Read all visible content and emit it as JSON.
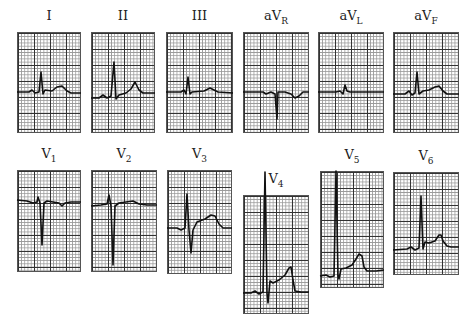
{
  "figure": {
    "leads": [
      {
        "id": "I",
        "name": "I",
        "sub": "",
        "x": 17,
        "y": 32,
        "w": 64,
        "h": 101,
        "path": "M0,60 L12,60 L15,58 L18,61 L22,60 L24,40 L26,62 L28,58 L35,59 L40,55 L45,54 L50,59 L54,61 L64,61"
      },
      {
        "id": "II",
        "name": "II",
        "sub": "",
        "x": 91,
        "y": 32,
        "w": 64,
        "h": 101,
        "path": "M0,66 L8,66 L12,63 L16,66 L20,64 L23,30 L25,67 L28,63 L35,61 L40,57 L44,50 L48,58 L52,61 L64,61"
      },
      {
        "id": "III",
        "name": "III",
        "sub": "",
        "x": 166,
        "y": 32,
        "w": 67,
        "h": 101,
        "path": "M0,60 L15,60 L18,58 L20,62 L22,45 L24,62 L26,60 L38,59 L44,56 L48,58 L52,60 L67,61"
      },
      {
        "id": "aVR",
        "name": "aV",
        "sub": "R",
        "x": 243,
        "y": 32,
        "w": 66,
        "h": 101,
        "path": "M0,60 L20,60 L23,62 L28,60 L32,62 L34,87 L35,60 L42,60 L48,62 L52,66 L56,64 L60,60 L66,60"
      },
      {
        "id": "aVL",
        "name": "aV",
        "sub": "L",
        "x": 318,
        "y": 32,
        "w": 66,
        "h": 101,
        "path": "M0,60 L18,60 L22,59 L25,62 L27,53 L29,59 L32,60 L45,60 L55,60 L66,60"
      },
      {
        "id": "aVF",
        "name": "aV",
        "sub": "F",
        "x": 393,
        "y": 32,
        "w": 66,
        "h": 101,
        "path": "M0,62 L12,62 L16,59 L19,63 L22,61 L24,40 L26,62 L30,59 L36,58 L42,55 L46,54 L50,59 L54,62 L66,62"
      },
      {
        "id": "V1",
        "name": "V",
        "sub": "1",
        "x": 17,
        "y": 170,
        "w": 64,
        "h": 102,
        "path": "M0,30 L10,31 L16,33 L20,32 L21,27 L23,33 L25,75 L27,33 L30,31 L36,32 L42,33 L45,36 L48,33 L54,32 L64,32"
      },
      {
        "id": "V2",
        "name": "V",
        "sub": "2",
        "x": 91,
        "y": 170,
        "w": 66,
        "h": 102,
        "path": "M0,36 L10,35 L16,34 L18,25 L20,36 L22,95 L24,36 L28,33 L35,32 L42,31 L48,34 L56,35 L66,35"
      },
      {
        "id": "V3",
        "name": "V",
        "sub": "3",
        "x": 167,
        "y": 170,
        "w": 65,
        "h": 104,
        "path": "M0,58 L10,58 L14,60 L18,58 L20,24 L22,60 L24,83 L26,60 L30,52 L38,49 L44,45 L48,46 L52,54 L56,58 L65,58"
      },
      {
        "id": "V4",
        "name": "V",
        "sub": "4",
        "x": 243,
        "y": 195,
        "w": 66,
        "h": 119,
        "path": "M0,98 L8,98 L12,96 L16,99 L20,97 L22,-23 L24,98 L25,108 L27,86 L30,88 L36,85 L42,80 L46,73 L48,72 L50,85 L52,96 L58,97 L66,97"
      },
      {
        "id": "V5",
        "name": "V",
        "sub": "5",
        "x": 320,
        "y": 171,
        "w": 64,
        "h": 117,
        "path": "M0,105 L6,104 L10,106 L14,105 L16,0 L18,104 L19,108 L21,98 L26,97 L32,94 L36,88 L39,83 L42,85 L44,96 L47,100 L56,100 L64,99"
      },
      {
        "id": "V6",
        "name": "V",
        "sub": "6",
        "x": 393,
        "y": 172,
        "w": 66,
        "h": 103,
        "path": "M0,78 L14,77 L18,75 L22,78 L26,76 L28,24 L30,77 L32,70 L36,71 L42,69 L46,63 L48,63 L50,69 L54,74 L58,75 L66,75"
      }
    ]
  }
}
